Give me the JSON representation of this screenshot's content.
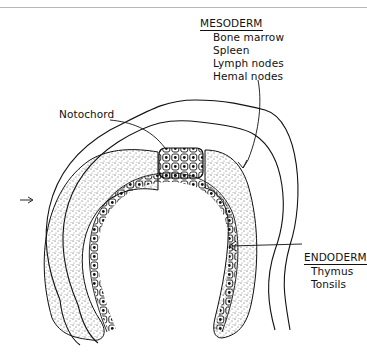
{
  "figure": {
    "type": "embryo cross-section illustration",
    "labels": {
      "notochord": "Notochord",
      "mesoderm": {
        "heading": "MESODERM",
        "items": [
          "Bone marrow",
          "Spleen",
          "Lymph nodes",
          "Hemal nodes"
        ]
      },
      "endoderm": {
        "heading": "ENDODERM",
        "items": [
          "Thymus",
          "Tonsils"
        ]
      }
    },
    "colors": {
      "ink": "#111111",
      "stipple": "#333333",
      "background": "#ffffff",
      "top_rule": "#b8b8b8"
    }
  }
}
